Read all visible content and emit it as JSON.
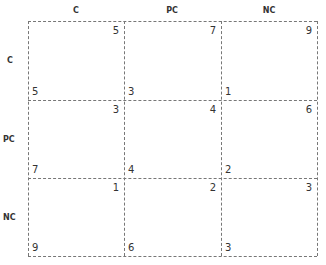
{
  "matrix": {
    "column_headers": [
      "C",
      "PC",
      "NC"
    ],
    "row_headers": [
      "C",
      "PC",
      "NC"
    ],
    "cells": [
      [
        {
          "top_right": "5",
          "bottom_left": "5"
        },
        {
          "top_right": "7",
          "bottom_left": "3"
        },
        {
          "top_right": "9",
          "bottom_left": "1"
        }
      ],
      [
        {
          "top_right": "3",
          "bottom_left": "7"
        },
        {
          "top_right": "4",
          "bottom_left": "4"
        },
        {
          "top_right": "6",
          "bottom_left": "2"
        }
      ],
      [
        {
          "top_right": "1",
          "bottom_left": "9"
        },
        {
          "top_right": "2",
          "bottom_left": "6"
        },
        {
          "top_right": "3",
          "bottom_left": "3"
        }
      ]
    ]
  },
  "colors": {
    "text": "#333333",
    "grid_line": "#777777",
    "background": "#ffffff"
  }
}
